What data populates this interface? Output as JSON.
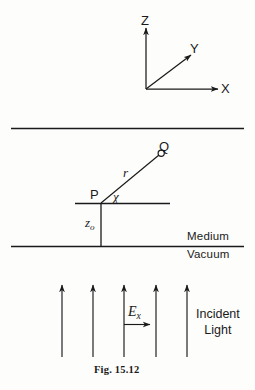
{
  "figure": {
    "caption": "Fig. 15.12",
    "axes": {
      "z_label": "Z",
      "y_label": "Y",
      "x_label": "X"
    },
    "geometry": {
      "point_p": "P",
      "point_q": "Q",
      "radius_label": "r",
      "angle_label": "χ",
      "depth_label_base": "z",
      "depth_label_sub": "o"
    },
    "interface": {
      "upper_medium": "Medium",
      "lower_medium": "Vacuum"
    },
    "field": {
      "symbol_base": "E",
      "symbol_sub": "x"
    },
    "source": {
      "line1": "Incident",
      "line2": "Light"
    },
    "colors": {
      "ink": "#1a1a1a",
      "background": "#fdfdfc"
    }
  }
}
